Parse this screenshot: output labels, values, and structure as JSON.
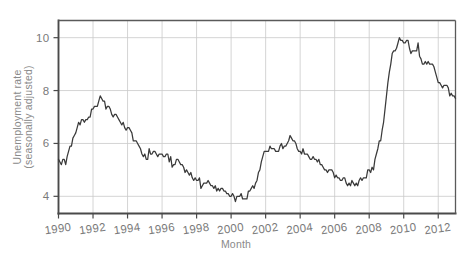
{
  "chart_data": {
    "type": "line",
    "title": "",
    "subtitle": "",
    "xlabel": "Month",
    "ylabel": "Unemployment rate (seasonally adjusted)",
    "ylabel_line1": "Unemployment rate",
    "ylabel_line2": "(seasonally adjusted)",
    "xlim": [
      1990.0,
      2013.0
    ],
    "ylim": [
      3.35,
      10.65
    ],
    "grid": true,
    "legend": "none",
    "line_color": "#3a3a3a",
    "grid_color": "#c9c9c9",
    "axis_color": "#4a4a4a",
    "tick_label_color": "#7a7a7a",
    "background_color": "#ffffff",
    "xticks": [
      1990,
      1992,
      1994,
      1996,
      1998,
      2000,
      2002,
      2004,
      2006,
      2008,
      2010,
      2012
    ],
    "xtick_labels": [
      "1990",
      "1992",
      "1994",
      "1996",
      "1998",
      "2000",
      "2002",
      "2004",
      "2006",
      "2008",
      "2010",
      "2012"
    ],
    "yticks": [
      4,
      6,
      8,
      10
    ],
    "ytick_labels": [
      "4",
      "6",
      "8",
      "10"
    ],
    "series": [
      {
        "name": "Unemployment rate (seasonally adjusted)",
        "x": [
          1990.0,
          1990.083,
          1990.167,
          1990.25,
          1990.333,
          1990.417,
          1990.5,
          1990.583,
          1990.667,
          1990.75,
          1990.833,
          1990.917,
          1991.0,
          1991.083,
          1991.167,
          1991.25,
          1991.333,
          1991.417,
          1991.5,
          1991.583,
          1991.667,
          1991.75,
          1991.833,
          1991.917,
          1992.0,
          1992.083,
          1992.167,
          1992.25,
          1992.333,
          1992.417,
          1992.5,
          1992.583,
          1992.667,
          1992.75,
          1992.833,
          1992.917,
          1993.0,
          1993.083,
          1993.167,
          1993.25,
          1993.333,
          1993.417,
          1993.5,
          1993.583,
          1993.667,
          1993.75,
          1993.833,
          1993.917,
          1994.0,
          1994.083,
          1994.167,
          1994.25,
          1994.333,
          1994.417,
          1994.5,
          1994.583,
          1994.667,
          1994.75,
          1994.833,
          1994.917,
          1995.0,
          1995.083,
          1995.167,
          1995.25,
          1995.333,
          1995.417,
          1995.5,
          1995.583,
          1995.667,
          1995.75,
          1995.833,
          1995.917,
          1996.0,
          1996.083,
          1996.167,
          1996.25,
          1996.333,
          1996.417,
          1996.5,
          1996.583,
          1996.667,
          1996.75,
          1996.833,
          1996.917,
          1997.0,
          1997.083,
          1997.167,
          1997.25,
          1997.333,
          1997.417,
          1997.5,
          1997.583,
          1997.667,
          1997.75,
          1997.833,
          1997.917,
          1998.0,
          1998.083,
          1998.167,
          1998.25,
          1998.333,
          1998.417,
          1998.5,
          1998.583,
          1998.667,
          1998.75,
          1998.833,
          1998.917,
          1999.0,
          1999.083,
          1999.167,
          1999.25,
          1999.333,
          1999.417,
          1999.5,
          1999.583,
          1999.667,
          1999.75,
          1999.833,
          1999.917,
          2000.0,
          2000.083,
          2000.167,
          2000.25,
          2000.333,
          2000.417,
          2000.5,
          2000.583,
          2000.667,
          2000.75,
          2000.833,
          2000.917,
          2001.0,
          2001.083,
          2001.167,
          2001.25,
          2001.333,
          2001.417,
          2001.5,
          2001.583,
          2001.667,
          2001.75,
          2001.833,
          2001.917,
          2002.0,
          2002.083,
          2002.167,
          2002.25,
          2002.333,
          2002.417,
          2002.5,
          2002.583,
          2002.667,
          2002.75,
          2002.833,
          2002.917,
          2003.0,
          2003.083,
          2003.167,
          2003.25,
          2003.333,
          2003.417,
          2003.5,
          2003.583,
          2003.667,
          2003.75,
          2003.833,
          2003.917,
          2004.0,
          2004.083,
          2004.167,
          2004.25,
          2004.333,
          2004.417,
          2004.5,
          2004.583,
          2004.667,
          2004.75,
          2004.833,
          2004.917,
          2005.0,
          2005.083,
          2005.167,
          2005.25,
          2005.333,
          2005.417,
          2005.5,
          2005.583,
          2005.667,
          2005.75,
          2005.833,
          2005.917,
          2006.0,
          2006.083,
          2006.167,
          2006.25,
          2006.333,
          2006.417,
          2006.5,
          2006.583,
          2006.667,
          2006.75,
          2006.833,
          2006.917,
          2007.0,
          2007.083,
          2007.167,
          2007.25,
          2007.333,
          2007.417,
          2007.5,
          2007.583,
          2007.667,
          2007.75,
          2007.833,
          2007.917,
          2008.0,
          2008.083,
          2008.167,
          2008.25,
          2008.333,
          2008.417,
          2008.5,
          2008.583,
          2008.667,
          2008.75,
          2008.833,
          2008.917,
          2009.0,
          2009.083,
          2009.167,
          2009.25,
          2009.333,
          2009.417,
          2009.5,
          2009.583,
          2009.667,
          2009.75,
          2009.833,
          2009.917,
          2010.0,
          2010.083,
          2010.167,
          2010.25,
          2010.333,
          2010.417,
          2010.5,
          2010.583,
          2010.667,
          2010.75,
          2010.833,
          2010.917,
          2011.0,
          2011.083,
          2011.167,
          2011.25,
          2011.333,
          2011.417,
          2011.5,
          2011.583,
          2011.667,
          2011.75,
          2011.833,
          2011.917,
          2012.0,
          2012.083,
          2012.167,
          2012.25,
          2012.333,
          2012.417,
          2012.5,
          2012.583,
          2012.667,
          2012.75,
          2012.833,
          2012.917,
          2013.0
        ],
        "values": [
          5.4,
          5.3,
          5.2,
          5.4,
          5.4,
          5.2,
          5.5,
          5.7,
          5.9,
          5.9,
          6.2,
          6.3,
          6.4,
          6.6,
          6.8,
          6.7,
          6.9,
          6.9,
          6.8,
          6.9,
          6.9,
          7.0,
          7.0,
          7.3,
          7.3,
          7.4,
          7.4,
          7.4,
          7.6,
          7.8,
          7.7,
          7.6,
          7.6,
          7.3,
          7.4,
          7.4,
          7.3,
          7.1,
          7.0,
          7.1,
          7.1,
          7.0,
          6.9,
          6.8,
          6.7,
          6.8,
          6.6,
          6.5,
          6.6,
          6.6,
          6.5,
          6.4,
          6.1,
          6.1,
          6.1,
          6.0,
          5.9,
          5.8,
          5.6,
          5.5,
          5.6,
          5.4,
          5.4,
          5.8,
          5.6,
          5.6,
          5.7,
          5.7,
          5.6,
          5.5,
          5.6,
          5.6,
          5.6,
          5.5,
          5.5,
          5.6,
          5.6,
          5.3,
          5.5,
          5.1,
          5.2,
          5.2,
          5.4,
          5.4,
          5.3,
          5.2,
          5.2,
          5.1,
          4.9,
          5.0,
          4.9,
          4.8,
          4.9,
          4.7,
          4.6,
          4.7,
          4.6,
          4.6,
          4.7,
          4.3,
          4.4,
          4.5,
          4.5,
          4.5,
          4.6,
          4.5,
          4.4,
          4.4,
          4.3,
          4.4,
          4.2,
          4.3,
          4.2,
          4.3,
          4.3,
          4.2,
          4.2,
          4.1,
          4.1,
          4.0,
          4.0,
          4.1,
          4.0,
          3.8,
          4.0,
          4.0,
          4.0,
          4.1,
          3.9,
          3.9,
          3.9,
          3.9,
          4.2,
          4.2,
          4.3,
          4.4,
          4.3,
          4.5,
          4.6,
          4.9,
          5.0,
          5.3,
          5.5,
          5.7,
          5.7,
          5.7,
          5.7,
          5.9,
          5.8,
          5.8,
          5.8,
          5.7,
          5.7,
          5.7,
          5.9,
          6.0,
          5.8,
          5.9,
          5.9,
          6.0,
          6.1,
          6.3,
          6.2,
          6.1,
          6.1,
          6.0,
          5.8,
          5.7,
          5.7,
          5.6,
          5.8,
          5.6,
          5.6,
          5.6,
          5.5,
          5.4,
          5.4,
          5.5,
          5.4,
          5.4,
          5.3,
          5.4,
          5.2,
          5.2,
          5.1,
          5.0,
          5.0,
          4.9,
          5.0,
          5.0,
          5.0,
          4.9,
          4.7,
          4.8,
          4.7,
          4.7,
          4.6,
          4.6,
          4.7,
          4.7,
          4.5,
          4.4,
          4.5,
          4.4,
          4.6,
          4.5,
          4.4,
          4.5,
          4.4,
          4.6,
          4.7,
          4.6,
          4.7,
          4.7,
          4.7,
          5.0,
          5.0,
          4.9,
          5.1,
          5.0,
          5.4,
          5.6,
          5.8,
          6.1,
          6.1,
          6.5,
          6.8,
          7.3,
          7.8,
          8.3,
          8.7,
          9.0,
          9.4,
          9.5,
          9.5,
          9.6,
          9.8,
          10.0,
          9.9,
          9.9,
          9.8,
          9.8,
          9.9,
          9.9,
          9.6,
          9.4,
          9.5,
          9.5,
          9.5,
          9.5,
          9.8,
          9.3,
          9.2,
          9.0,
          9.0,
          9.1,
          9.0,
          9.1,
          9.0,
          9.0,
          9.0,
          8.9,
          8.7,
          8.5,
          8.3,
          8.3,
          8.2,
          8.1,
          8.2,
          8.2,
          8.2,
          8.1,
          7.8,
          7.9,
          7.8,
          7.8,
          7.7
        ]
      }
    ]
  },
  "axis_titles": {
    "x": "Month",
    "y_line1": "Unemployment rate",
    "y_line2": "(seasonally adjusted)"
  }
}
